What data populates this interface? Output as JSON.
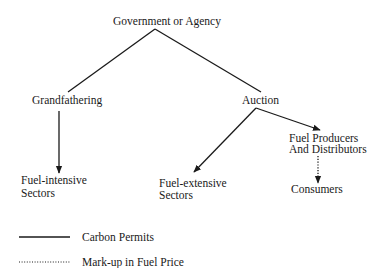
{
  "nodes": {
    "root": "Government or Agency",
    "grandfathering": "Grandfathering",
    "auction": "Auction",
    "fuel_intensive": [
      "Fuel-intensive",
      "Sectors"
    ],
    "fuel_extensive": [
      "Fuel-extensive",
      "Sectors"
    ],
    "producers": [
      "Fuel Producers",
      "And Distributors"
    ],
    "consumers": "Consumers"
  },
  "edges": [
    {
      "from": "Government or Agency",
      "to": "Grandfathering",
      "style": "solid"
    },
    {
      "from": "Government or Agency",
      "to": "Auction",
      "style": "solid"
    },
    {
      "from": "Grandfathering",
      "to": "Fuel-intensive Sectors",
      "style": "solid-arrow"
    },
    {
      "from": "Auction",
      "to": "Fuel-extensive Sectors",
      "style": "solid-arrow"
    },
    {
      "from": "Auction",
      "to": "Fuel Producers And Distributors",
      "style": "solid-arrow"
    },
    {
      "from": "Fuel Producers And Distributors",
      "to": "Consumers",
      "style": "dotted-arrow"
    }
  ],
  "legend": {
    "solid": "Carbon Permits",
    "dotted": "Mark-up in Fuel Price"
  },
  "colors": {
    "line": "#1a1a1a",
    "background": "#ffffff"
  }
}
